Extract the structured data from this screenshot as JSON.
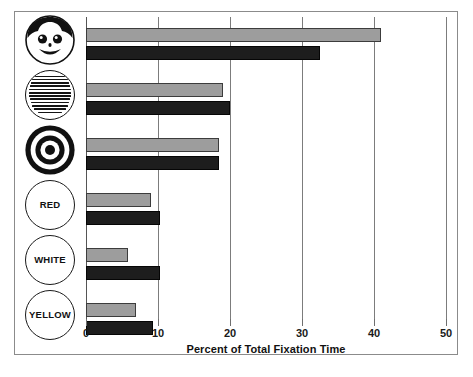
{
  "figure": {
    "xaxis_title": "Percent of Total Fixation Time"
  },
  "chart_data": {
    "type": "bar",
    "orientation": "horizontal",
    "title": "",
    "xlabel": "Percent of Total Fixation Time",
    "ylabel": "",
    "xlim": [
      0,
      50
    ],
    "xticks": [
      0,
      10,
      20,
      30,
      40,
      50
    ],
    "xtick_labels": [
      "0",
      "10",
      "20",
      "30",
      "40",
      "50"
    ],
    "grid": "vertical gridlines at every x tick",
    "legend": "none",
    "categories": [
      "face-icon",
      "text-page-icon",
      "bullseye-icon",
      "RED",
      "WHITE",
      "YELLOW"
    ],
    "category_labels": [
      "",
      "",
      "",
      "RED",
      "WHITE",
      "YELLOW"
    ],
    "series": [
      {
        "name": "gray-series",
        "color": "#9d9d9d",
        "values": [
          41.0,
          19.0,
          18.5,
          9.0,
          5.8,
          7.0
        ]
      },
      {
        "name": "black-series",
        "color": "#1d1d1d",
        "values": [
          32.5,
          20.0,
          18.5,
          10.3,
          10.3,
          9.3
        ]
      }
    ]
  },
  "icons": [
    {
      "id": "face-icon",
      "name": "smiling-face-icon",
      "label": ""
    },
    {
      "id": "text-page-icon",
      "name": "text-passage-icon",
      "label": ""
    },
    {
      "id": "bullseye-icon",
      "name": "bullseye-target-icon",
      "label": ""
    },
    {
      "id": "red-circle",
      "name": "red-color-circle",
      "label": "RED"
    },
    {
      "id": "white-circle",
      "name": "white-color-circle",
      "label": "WHITE"
    },
    {
      "id": "yellow-circle",
      "name": "yellow-color-circle",
      "label": "YELLOW"
    }
  ],
  "colors": {
    "gray_bar": "#9d9d9d",
    "black_bar": "#1d1d1d",
    "gridline": "#7c7c7c",
    "frame": "#8b8b8b",
    "background": "#ffffff"
  }
}
